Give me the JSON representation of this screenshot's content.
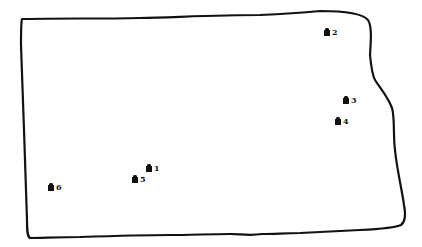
{
  "map": {
    "outline_color": "#111111",
    "marker_color": "#111111",
    "background": "#ffffff",
    "markers": [
      {
        "id": "1",
        "label": "1",
        "icon": "building-icon",
        "x": 146,
        "y": 163
      },
      {
        "id": "2",
        "label": "2",
        "icon": "building-icon",
        "x": 324,
        "y": 27
      },
      {
        "id": "3",
        "label": "3",
        "icon": "building-icon",
        "x": 343,
        "y": 95
      },
      {
        "id": "4",
        "label": "4",
        "icon": "building-icon",
        "x": 335,
        "y": 116
      },
      {
        "id": "5",
        "label": "5",
        "icon": "building-icon",
        "x": 132,
        "y": 174
      },
      {
        "id": "6",
        "label": "6",
        "icon": "building-icon",
        "x": 48,
        "y": 182
      }
    ]
  }
}
